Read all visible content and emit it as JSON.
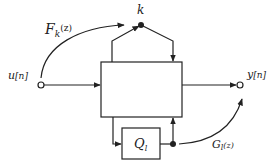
{
  "diagram": {
    "type": "block-diagram",
    "nodes": {
      "input": {
        "label": "u[n]",
        "label_main": "u",
        "label_arg": "[n]"
      },
      "output": {
        "label": "y[n]",
        "label_main": "y",
        "label_arg": "[n]"
      },
      "k_node": {
        "label": "k"
      },
      "main_block": {
        "label": ""
      },
      "q_block": {
        "label": "Q_l",
        "label_main": "Q",
        "label_sub": "l"
      }
    },
    "edges": {
      "F": {
        "label": "F_k(z)",
        "label_main": "F",
        "label_sub": "k",
        "label_arg": "(z)"
      },
      "G": {
        "label": "G_l(z)",
        "label_main": "G",
        "label_sub": "l",
        "label_arg": "(z)"
      }
    },
    "colors": {
      "stroke": "#222222",
      "background": "#ffffff"
    }
  }
}
